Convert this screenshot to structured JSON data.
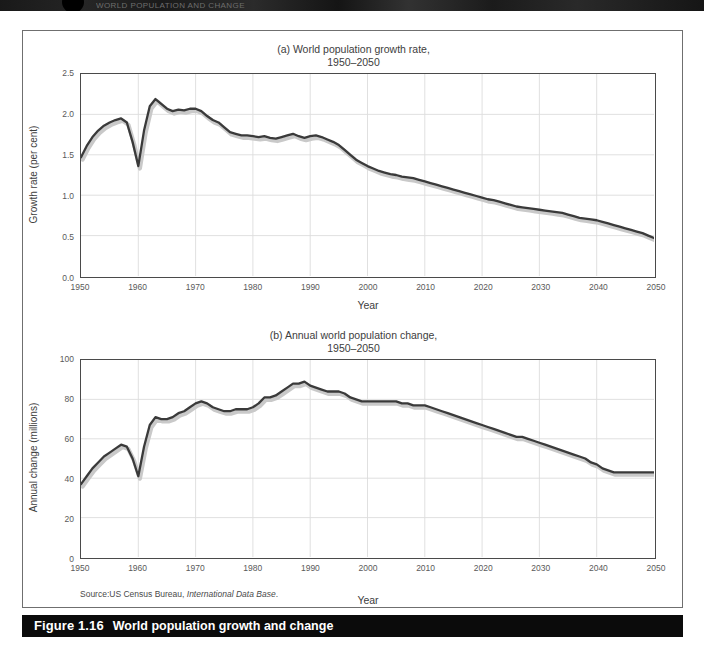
{
  "page": {
    "top_strip_text": "WORLD POPULATION AND CHANGE",
    "background_color": "#ffffff"
  },
  "figure": {
    "caption_number": "Figure 1.16",
    "caption_text": "World population growth and change",
    "caption_bar_color": "#0b0b0b",
    "source_prefix": "Source:US Census Bureau, ",
    "source_italic": "International Data Base",
    "source_suffix": "."
  },
  "chart_data": [
    {
      "type": "line",
      "id": "growth-rate",
      "title": "(a) World population growth rate,",
      "subtitle": "1950–2050",
      "xlabel": "Year",
      "ylabel": "Growth rate (per cent)",
      "xlim": [
        1950,
        2050
      ],
      "ylim": [
        0.0,
        2.5
      ],
      "xticks": [
        1950,
        1960,
        1970,
        1980,
        1990,
        2000,
        2010,
        2020,
        2030,
        2040,
        2050
      ],
      "xtick_labels": [
        "1950",
        "1960",
        "1970",
        "1980",
        "1990",
        "2000",
        "2010",
        "2020",
        "2030",
        "2040",
        "2050"
      ],
      "yticks": [
        0.0,
        0.5,
        1.0,
        1.5,
        2.0,
        2.5
      ],
      "ytick_labels": [
        "0.0",
        "0.5",
        "1.0",
        "1.5",
        "2.0",
        "2.5"
      ],
      "grid": true,
      "legend": "none",
      "line_color": "#3a3a3a",
      "shadow_color": "#c9c9c9",
      "x": [
        1950,
        1951,
        1952,
        1953,
        1954,
        1955,
        1956,
        1957,
        1958,
        1959,
        1960,
        1961,
        1962,
        1963,
        1964,
        1965,
        1966,
        1967,
        1968,
        1969,
        1970,
        1971,
        1972,
        1973,
        1974,
        1975,
        1976,
        1977,
        1978,
        1979,
        1980,
        1981,
        1982,
        1983,
        1984,
        1985,
        1986,
        1987,
        1988,
        1989,
        1990,
        1991,
        1992,
        1993,
        1994,
        1995,
        1996,
        1997,
        1998,
        1999,
        2000,
        2001,
        2002,
        2003,
        2004,
        2005,
        2006,
        2007,
        2008,
        2009,
        2010,
        2011,
        2012,
        2013,
        2014,
        2015,
        2016,
        2017,
        2018,
        2019,
        2020,
        2021,
        2022,
        2023,
        2024,
        2025,
        2026,
        2027,
        2028,
        2029,
        2030,
        2031,
        2032,
        2033,
        2034,
        2035,
        2036,
        2037,
        2038,
        2039,
        2040,
        2041,
        2042,
        2043,
        2044,
        2045,
        2046,
        2047,
        2048,
        2049,
        2050
      ],
      "values": [
        1.47,
        1.61,
        1.72,
        1.8,
        1.86,
        1.9,
        1.93,
        1.95,
        1.9,
        1.66,
        1.36,
        1.8,
        2.1,
        2.19,
        2.13,
        2.07,
        2.04,
        2.06,
        2.05,
        2.07,
        2.07,
        2.04,
        1.98,
        1.93,
        1.9,
        1.84,
        1.78,
        1.76,
        1.74,
        1.74,
        1.73,
        1.72,
        1.73,
        1.71,
        1.7,
        1.72,
        1.74,
        1.76,
        1.73,
        1.71,
        1.73,
        1.74,
        1.72,
        1.69,
        1.66,
        1.62,
        1.56,
        1.5,
        1.44,
        1.4,
        1.36,
        1.33,
        1.3,
        1.28,
        1.26,
        1.25,
        1.23,
        1.22,
        1.21,
        1.19,
        1.17,
        1.15,
        1.13,
        1.11,
        1.09,
        1.07,
        1.05,
        1.03,
        1.01,
        0.99,
        0.97,
        0.95,
        0.94,
        0.92,
        0.9,
        0.88,
        0.86,
        0.85,
        0.84,
        0.83,
        0.82,
        0.81,
        0.8,
        0.79,
        0.78,
        0.76,
        0.74,
        0.72,
        0.71,
        0.7,
        0.69,
        0.67,
        0.65,
        0.63,
        0.61,
        0.59,
        0.57,
        0.55,
        0.53,
        0.5,
        0.47
      ]
    },
    {
      "type": "line",
      "id": "annual-change",
      "title": "(b) Annual world population change,",
      "subtitle": "1950–2050",
      "xlabel": "Year",
      "ylabel": "Annual change (millions)",
      "xlim": [
        1950,
        2050
      ],
      "ylim": [
        0,
        100
      ],
      "xticks": [
        1950,
        1960,
        1970,
        1980,
        1990,
        2000,
        2010,
        2020,
        2030,
        2040,
        2050
      ],
      "xtick_labels": [
        "1950",
        "1960",
        "1970",
        "1980",
        "1990",
        "2000",
        "2010",
        "2020",
        "2030",
        "2040",
        "2050"
      ],
      "yticks": [
        0,
        20,
        40,
        60,
        80,
        100
      ],
      "ytick_labels": [
        "0",
        "20",
        "40",
        "60",
        "80",
        "100"
      ],
      "grid": true,
      "legend": "none",
      "line_color": "#3a3a3a",
      "shadow_color": "#c9c9c9",
      "x": [
        1950,
        1951,
        1952,
        1953,
        1954,
        1955,
        1956,
        1957,
        1958,
        1959,
        1960,
        1961,
        1962,
        1963,
        1964,
        1965,
        1966,
        1967,
        1968,
        1969,
        1970,
        1971,
        1972,
        1973,
        1974,
        1975,
        1976,
        1977,
        1978,
        1979,
        1980,
        1981,
        1982,
        1983,
        1984,
        1985,
        1986,
        1987,
        1988,
        1989,
        1990,
        1991,
        1992,
        1993,
        1994,
        1995,
        1996,
        1997,
        1998,
        1999,
        2000,
        2001,
        2002,
        2003,
        2004,
        2005,
        2006,
        2007,
        2008,
        2009,
        2010,
        2011,
        2012,
        2013,
        2014,
        2015,
        2016,
        2017,
        2018,
        2019,
        2020,
        2021,
        2022,
        2023,
        2024,
        2025,
        2026,
        2027,
        2028,
        2029,
        2030,
        2031,
        2032,
        2033,
        2034,
        2035,
        2036,
        2037,
        2038,
        2039,
        2040,
        2041,
        2042,
        2043,
        2044,
        2045,
        2046,
        2047,
        2048,
        2049,
        2050
      ],
      "values": [
        37,
        41,
        45,
        48,
        51,
        53,
        55,
        57,
        56,
        50,
        41,
        56,
        67,
        71,
        70,
        70,
        71,
        73,
        74,
        76,
        78,
        79,
        78,
        76,
        75,
        74,
        74,
        75,
        75,
        75,
        76,
        78,
        81,
        81,
        82,
        84,
        86,
        88,
        88,
        89,
        87,
        86,
        85,
        84,
        84,
        84,
        83,
        81,
        80,
        79,
        79,
        79,
        79,
        79,
        79,
        79,
        78,
        78,
        77,
        77,
        77,
        76,
        75,
        74,
        73,
        72,
        71,
        70,
        69,
        68,
        67,
        66,
        65,
        64,
        63,
        62,
        61,
        61,
        60,
        59,
        58,
        57,
        56,
        55,
        54,
        53,
        52,
        51,
        50,
        48,
        47,
        45,
        44,
        43,
        43,
        43,
        43,
        43,
        43,
        43,
        43
      ]
    }
  ],
  "ghost_text": {
    "g1": "population decline",
    "g2": "the rate of growth",
    "g3": "in many countries",
    "g4": "demographic",
    "g5": "and change"
  }
}
